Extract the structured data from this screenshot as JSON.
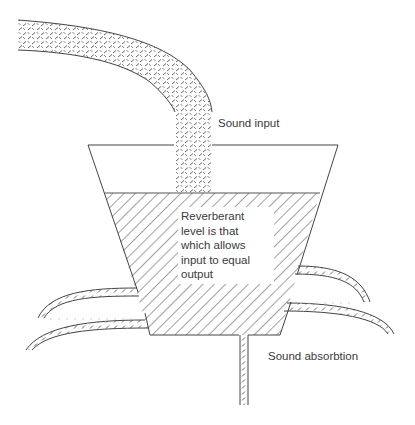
{
  "diagram": {
    "type": "conceptual-illustration",
    "labels": {
      "input": "Sound input",
      "absorption": "Sound absorbtion",
      "reverberant_line1": "Reverberant",
      "reverberant_line2": "level is that",
      "reverberant_line3": "which allows",
      "reverberant_line4": "input to equal",
      "reverberant_line5": "output"
    },
    "colors": {
      "stroke": "#333333",
      "hatch": "#444444",
      "text": "#3a3a3a",
      "background": "#ffffff"
    }
  }
}
